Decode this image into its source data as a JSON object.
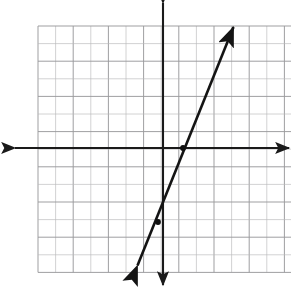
{
  "problem": {
    "number": "7."
  },
  "colors": {
    "grid_line": "#b9b9bb",
    "grid_line_major": "#9a9a9c",
    "axis": "#1a1a1a",
    "curve": "#141414",
    "point": "#101010",
    "background": "#ffffff",
    "label_text": "#58585a"
  },
  "chart_data": {
    "type": "line",
    "title": "",
    "subtitle": "",
    "xlabel": "",
    "ylabel": "",
    "grid": true,
    "grid_step": 1,
    "legend": "none",
    "xlim": [
      -7,
      10
    ],
    "ylim": [
      -7,
      7
    ],
    "axes": {
      "x_axis_arrows": [
        "left",
        "right"
      ],
      "y_axis_arrows": [
        "up",
        "down"
      ],
      "tick_labels_x": [],
      "tick_labels_y": [],
      "origin": [
        0,
        0
      ]
    },
    "series": [
      {
        "name": "line",
        "type": "line",
        "arrows": [
          "start",
          "end"
        ],
        "equation": "y = 3x - 3",
        "slope": 3,
        "y_intercept": -3,
        "x_intercept": 1,
        "x": [
          -0.3,
          4.0
        ],
        "y": [
          -3.9,
          9.0
        ],
        "points": [
          {
            "x": 1,
            "y": 0,
            "marked": true
          },
          {
            "x": -0.3,
            "y": -3.9,
            "marked": true
          }
        ]
      }
    ],
    "annotations": []
  },
  "geometry": {
    "grid": {
      "left": 38,
      "top": 26,
      "cell": 17.6,
      "cols": 17,
      "rows": 14
    },
    "origin": {
      "x": 163.0,
      "y": 148.0
    },
    "x_axis": {
      "x1": 15,
      "x2": 289,
      "y": 148
    },
    "y_axis": {
      "x": 163,
      "y1": 3,
      "y2": 285
    },
    "line": {
      "x1": 137.5,
      "y1": 265.5,
      "x2": 233.5,
      "y2": 27.0
    },
    "markers": [
      {
        "x": 183.0,
        "y": 148.0
      },
      {
        "x": 158.0,
        "y": 222.0
      }
    ]
  }
}
